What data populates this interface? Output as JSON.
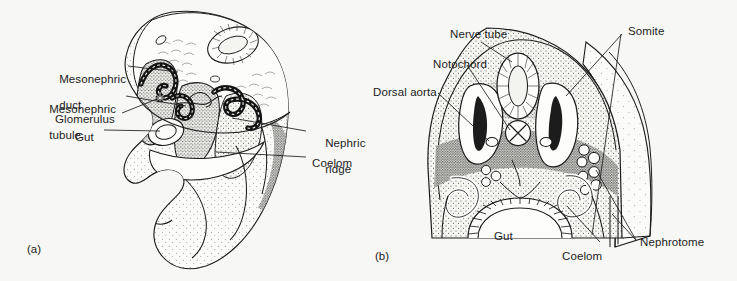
{
  "figure": {
    "type": "anatomical-line-drawing",
    "background_color": "#f7f7f5",
    "ink_color": "#1c1c1c",
    "panels": [
      {
        "id": "a",
        "caption": "(a)",
        "description": "Three-dimensional cutaway view of an embryo showing the nephric ridge and mesonephric structures"
      },
      {
        "id": "b",
        "caption": "(b)",
        "description": "Transverse section of an embryo showing the nerve tube, notochord, somites and nephrotome"
      }
    ]
  },
  "panel_a": {
    "caption": "(a)",
    "labels": [
      {
        "id": "mesonephric-duct",
        "line1": "Mesonephric",
        "line2": "duct"
      },
      {
        "id": "mesonephric-tubule",
        "line1": "Mesonephric",
        "line2": "tubule"
      },
      {
        "id": "glomerulus",
        "line1": "Glomerulus",
        "line2": ""
      },
      {
        "id": "gut",
        "line1": "Gut",
        "line2": ""
      },
      {
        "id": "nephric-ridge",
        "line1": "Nephric",
        "line2": "ridge"
      },
      {
        "id": "coelom",
        "line1": "Coelom",
        "line2": ""
      }
    ]
  },
  "panel_b": {
    "caption": "(b)",
    "labels": [
      {
        "id": "nerve-tube",
        "line1": "Nerve tube",
        "line2": ""
      },
      {
        "id": "notochord",
        "line1": "Notochord",
        "line2": ""
      },
      {
        "id": "dorsal-aorta",
        "line1": "Dorsal aorta",
        "line2": ""
      },
      {
        "id": "somite",
        "line1": "Somite",
        "line2": ""
      },
      {
        "id": "gut",
        "line1": "Gut",
        "line2": ""
      },
      {
        "id": "coelom",
        "line1": "Coelom",
        "line2": ""
      },
      {
        "id": "nephrotome",
        "line1": "Nephrotome",
        "line2": ""
      }
    ]
  }
}
